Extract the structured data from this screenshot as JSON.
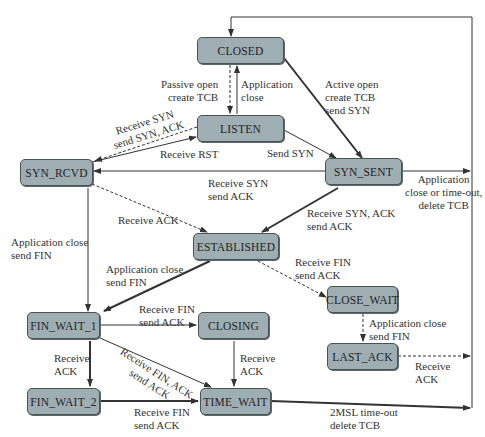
{
  "diagram": {
    "colors": {
      "state_fill": "#9eaeb3",
      "state_border": "#4a5256",
      "edge": "#333333",
      "text": "#333333"
    },
    "states": {
      "closed": "CLOSED",
      "listen": "LISTEN",
      "syn_rcvd": "SYN_RCVD",
      "syn_sent": "SYN_SENT",
      "established": "ESTABLISHED",
      "close_wait": "CLOSE_WAIT",
      "fin_wait_1": "FIN_WAIT_1",
      "closing": "CLOSING",
      "last_ack": "LAST_ACK",
      "fin_wait_2": "FIN_WAIT_2",
      "time_wait": "TIME_WAIT"
    },
    "transitions": {
      "passive_open": "Passive open\ncreate TCB",
      "app_close_listen": "Application\nclose",
      "active_open": "Active open\ncreate TCB\nsend SYN",
      "listen_to_synrcvd": "Receive SYN\nsend SYN, ACK",
      "receive_rst": "Receive RST",
      "send_syn": "Send SYN",
      "synsent_to_synrcvd": "Receive SYN\nsend ACK",
      "synsent_timeout": "Application\nclose or time-out,\ndelete TCB",
      "synrcvd_receive_ack": "Receive ACK",
      "synrcvd_app_close": "Application close\nsend FIN",
      "synsent_to_established": "Receive SYN, ACK\nsend ACK",
      "established_app_close": "Application close\nsend FIN",
      "established_receive_fin": "Receive FIN\nsend ACK",
      "finwait1_to_closing": "Receive FIN\nsend ACK",
      "closewait_app_close": "Application close\nsend FIN",
      "finwait1_receive_ack": "Receive\nACK",
      "finwait1_to_timewait": "Receive FIN, ACK\nsend ACK",
      "closing_receive_ack": "Receive\nACK",
      "lastack_receive_ack": "Receive\nACK",
      "finwait2_to_timewait": "Receive FIN\nsend ACK",
      "timewait_timeout": "2MSL time-out\ndelete TCB"
    },
    "legend": {
      "thick_solid": "client path",
      "dashed": "server path",
      "thin_solid": "other transitions"
    }
  }
}
